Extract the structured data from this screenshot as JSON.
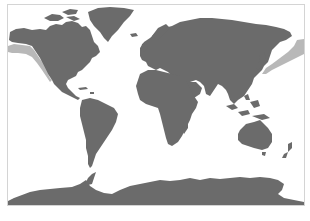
{
  "map": {
    "projection": "equirectangular-like world map",
    "frame": {
      "x": 7,
      "y": 4,
      "width": 297,
      "height": 201,
      "stroke": "#d4d4d4"
    },
    "colors": {
      "background": "#ffffff",
      "ocean": "#ffffff",
      "land": "#6b6b6b",
      "range_highlight": "#b8b8b8"
    },
    "regions": [
      {
        "name": "north-america",
        "label": "North America"
      },
      {
        "name": "greenland",
        "label": "Greenland"
      },
      {
        "name": "south-america",
        "label": "South America"
      },
      {
        "name": "europe-asia",
        "label": "Eurasia"
      },
      {
        "name": "africa",
        "label": "Africa"
      },
      {
        "name": "madagascar",
        "label": "Madagascar"
      },
      {
        "name": "australia",
        "label": "Australia"
      },
      {
        "name": "new-zealand",
        "label": "New Zealand"
      },
      {
        "name": "antarctica",
        "label": "Antarctica"
      },
      {
        "name": "japan",
        "label": "Japan"
      },
      {
        "name": "southeast-asia-islands",
        "label": "Maritime Southeast Asia"
      }
    ],
    "highlighted_range": [
      {
        "name": "range-north-pacific-east",
        "label": "North-east Pacific coastal band"
      },
      {
        "name": "range-north-pacific-west",
        "label": "North-west Pacific coastal band"
      }
    ]
  }
}
